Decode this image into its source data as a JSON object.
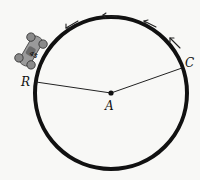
{
  "diagram": {
    "type": "circular-track",
    "center": {
      "label": "A",
      "x": 111,
      "y": 93
    },
    "radius": 76,
    "points": [
      {
        "label": "R",
        "x": 35,
        "y": 83
      },
      {
        "label": "C",
        "x": 183,
        "y": 66
      }
    ],
    "segments": [
      {
        "from": "A",
        "to": "R"
      },
      {
        "from": "A",
        "to": "C"
      }
    ],
    "direction": "counterclockwise",
    "arrow_count": 4,
    "car": {
      "number": "45",
      "position": "upper-left on track"
    }
  },
  "labels": {
    "center": "A",
    "point_r": "R",
    "point_c": "C",
    "car_number": "45"
  },
  "colors": {
    "stroke": "#111111",
    "car_body": "#9a9a9a",
    "background": "#f8f8f6"
  }
}
